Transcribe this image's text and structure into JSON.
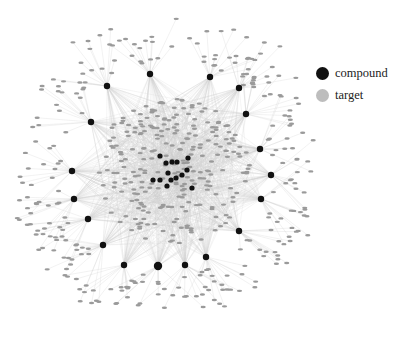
{
  "legend": {
    "items": [
      {
        "label": "compound",
        "color": "#111111"
      },
      {
        "label": "target",
        "color": "#bdbdbd"
      }
    ]
  },
  "network": {
    "edge_color": "#cfcfcf",
    "target_color": "#9a9a9a",
    "compound_color": "#111111",
    "hub_compounds": [
      [
        107,
        86
      ],
      [
        150,
        74
      ],
      [
        210,
        77
      ],
      [
        239,
        88
      ],
      [
        246,
        114
      ],
      [
        260,
        149
      ],
      [
        271,
        175
      ],
      [
        261,
        199
      ],
      [
        239,
        231
      ],
      [
        206,
        257
      ],
      [
        185,
        265
      ],
      [
        158,
        266
      ],
      [
        124,
        265
      ],
      [
        103,
        245
      ],
      [
        88,
        219
      ],
      [
        74,
        199
      ],
      [
        72,
        171
      ],
      [
        91,
        122
      ]
    ],
    "center_compounds": [
      [
        160,
        156
      ],
      [
        166,
        163
      ],
      [
        172,
        162
      ],
      [
        177,
        162
      ],
      [
        188,
        158
      ],
      [
        187,
        170
      ],
      [
        168,
        173
      ],
      [
        160,
        180
      ],
      [
        153,
        180
      ],
      [
        171,
        180
      ],
      [
        176,
        178
      ],
      [
        182,
        175
      ],
      [
        167,
        186
      ],
      [
        192,
        188
      ]
    ]
  }
}
